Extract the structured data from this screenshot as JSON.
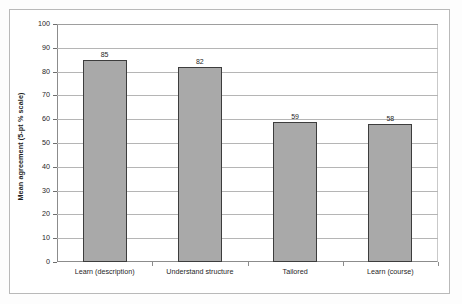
{
  "chart_data": {
    "type": "bar",
    "title": "",
    "subtitle": "",
    "xlabel": "",
    "ylabel": "Mean agreement (5-pt % scale)",
    "categories": [
      "Learn (description)",
      "Understand structure",
      "Tailored",
      "Learn (course)"
    ],
    "values": [
      85,
      82,
      59,
      58
    ],
    "value_labels": [
      "85",
      "82",
      "59",
      "58"
    ],
    "ylim": [
      0,
      100
    ],
    "ytick_step": 10,
    "ytick_labels": [
      "0",
      "10",
      "20",
      "30",
      "40",
      "50",
      "60",
      "70",
      "80",
      "90",
      "100"
    ],
    "grid": "horizontal",
    "legend": "none",
    "series": [
      {
        "name": "Mean agreement",
        "values": [
          85,
          82,
          59,
          58
        ]
      }
    ],
    "colors": {
      "bar_fill": "#a9a9a9",
      "bar_border": "#3d3d3d",
      "gridline": "#b5b5b5",
      "axis": "#8c8c8c",
      "frame": "#b9b9b9",
      "text": "#1f1f1f",
      "plot_background": "#ffffff"
    }
  }
}
